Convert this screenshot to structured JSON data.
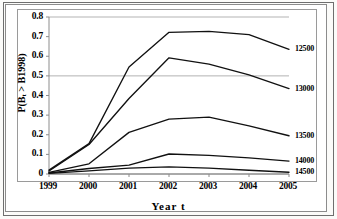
{
  "chart_data": {
    "type": "line",
    "title": "",
    "xlabel": "Year  t",
    "ylabel": "P(B",
    "ylabel_sub": "t",
    "ylabel_rest": " > B1998)",
    "ylabel_full": "P(Bt > B1998)",
    "x": [
      "1999",
      "2000",
      "2001",
      "2002",
      "2003",
      "2004",
      "2005"
    ],
    "xlim": [
      1999,
      2005
    ],
    "ylim": [
      0,
      0.8
    ],
    "yticks": [
      "0.8",
      "0.7",
      "0.6",
      "0.5",
      "0.4",
      "0.3",
      "0.2",
      "0.1",
      "0"
    ],
    "ytick_values": [
      0.8,
      0.7,
      0.6,
      0.5,
      0.4,
      0.3,
      0.2,
      0.1,
      0
    ],
    "gridlines": [
      0.5,
      0.8
    ],
    "grid": true,
    "legend_position": "right-of-plot",
    "series": [
      {
        "name": "12500",
        "values": [
          0.02,
          0.155,
          0.545,
          0.722,
          0.727,
          0.71,
          0.635
        ]
      },
      {
        "name": "13000",
        "values": [
          0.015,
          0.15,
          0.385,
          0.592,
          0.56,
          0.505,
          0.435
        ]
      },
      {
        "name": "13500",
        "values": [
          0.008,
          0.052,
          0.212,
          0.28,
          0.29,
          0.245,
          0.195
        ]
      },
      {
        "name": "14000",
        "values": [
          0.005,
          0.028,
          0.045,
          0.102,
          0.095,
          0.082,
          0.066
        ]
      },
      {
        "name": "14500",
        "values": [
          0.003,
          0.016,
          0.03,
          0.036,
          0.03,
          0.019,
          0.009
        ]
      }
    ]
  },
  "axis": {
    "y_label_text": "P(B",
    "y_label_sub": "t",
    "y_label_tail": " > B1998)",
    "x_label_text": "Year   t"
  }
}
